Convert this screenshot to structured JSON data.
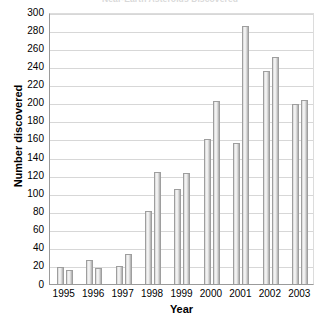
{
  "chart_data": {
    "type": "bar",
    "title": "Near-Earth Asteroids Discovered",
    "xlabel": "Year",
    "ylabel": "Number discovered",
    "categories": [
      "1995",
      "1996",
      "1997",
      "1998",
      "1999",
      "2000",
      "2001",
      "2002",
      "2003"
    ],
    "series": [
      {
        "name": "first",
        "values": [
          19,
          27,
          20,
          80,
          105,
          160,
          155,
          235,
          198
        ]
      },
      {
        "name": "second",
        "values": [
          15,
          18,
          33,
          123,
          122,
          202,
          285,
          250,
          203
        ]
      }
    ],
    "ylim": [
      0,
      300
    ],
    "ytick_step": 20,
    "yticks": [
      "300",
      "280",
      "260",
      "240",
      "220",
      "200",
      "180",
      "160",
      "140",
      "120",
      "100",
      "80",
      "60",
      "40",
      "20",
      "0"
    ],
    "grid": true,
    "legend": "none",
    "bar_color": "#e8e8e8",
    "bar_border_color": "#9e9e9e",
    "gridline_color": "#d7d7d7",
    "axis_color": "#9a9a9a",
    "background": "#ffffff"
  }
}
